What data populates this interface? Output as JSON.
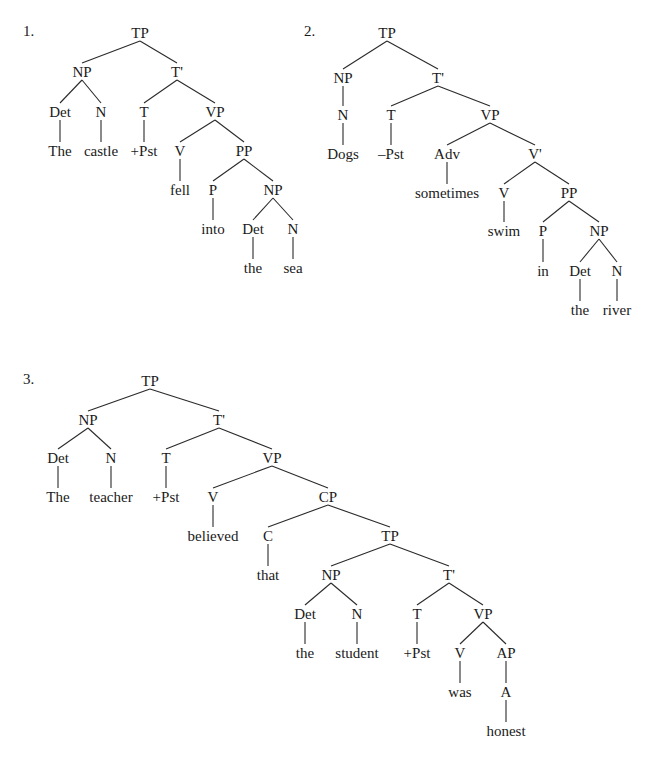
{
  "trees": [
    {
      "number": "1.",
      "number_pos": [
        23,
        30
      ],
      "nodes": [
        {
          "id": "TP",
          "label": "TP",
          "x": 140,
          "y": 33
        },
        {
          "id": "NP",
          "label": "NP",
          "x": 82,
          "y": 72,
          "parent": "TP"
        },
        {
          "id": "Tb",
          "label": "T'",
          "x": 177,
          "y": 72,
          "parent": "TP"
        },
        {
          "id": "Det",
          "label": "Det",
          "x": 60,
          "y": 112,
          "parent": "NP"
        },
        {
          "id": "N",
          "label": "N",
          "x": 101,
          "y": 112,
          "parent": "NP"
        },
        {
          "id": "T",
          "label": "T",
          "x": 144,
          "y": 112,
          "parent": "Tb"
        },
        {
          "id": "VP",
          "label": "VP",
          "x": 215,
          "y": 112,
          "parent": "Tb"
        },
        {
          "id": "w1",
          "label": "The",
          "x": 60,
          "y": 151,
          "parent": "Det",
          "straight": true
        },
        {
          "id": "w2",
          "label": "castle",
          "x": 101,
          "y": 151,
          "parent": "N",
          "straight": true
        },
        {
          "id": "w3",
          "label": "+Pst",
          "x": 144,
          "y": 151,
          "parent": "T",
          "straight": true
        },
        {
          "id": "V",
          "label": "V",
          "x": 180,
          "y": 151,
          "parent": "VP"
        },
        {
          "id": "PP",
          "label": "PP",
          "x": 244,
          "y": 151,
          "parent": "VP"
        },
        {
          "id": "w4",
          "label": "fell",
          "x": 180,
          "y": 190,
          "parent": "V",
          "straight": true
        },
        {
          "id": "P",
          "label": "P",
          "x": 213,
          "y": 190,
          "parent": "PP"
        },
        {
          "id": "NP2",
          "label": "NP",
          "x": 273,
          "y": 190,
          "parent": "PP"
        },
        {
          "id": "w5",
          "label": "into",
          "x": 213,
          "y": 229,
          "parent": "P",
          "straight": true
        },
        {
          "id": "Det2",
          "label": "Det",
          "x": 253,
          "y": 229,
          "parent": "NP2"
        },
        {
          "id": "N2",
          "label": "N",
          "x": 293,
          "y": 229,
          "parent": "NP2"
        },
        {
          "id": "w6",
          "label": "the",
          "x": 253,
          "y": 268,
          "parent": "Det2",
          "straight": true
        },
        {
          "id": "w7",
          "label": "sea",
          "x": 293,
          "y": 268,
          "parent": "N2",
          "straight": true
        }
      ]
    },
    {
      "number": "2.",
      "number_pos": [
        304,
        30
      ],
      "nodes": [
        {
          "id": "TP",
          "label": "TP",
          "x": 387,
          "y": 33
        },
        {
          "id": "NP",
          "label": "NP",
          "x": 343,
          "y": 78,
          "parent": "TP"
        },
        {
          "id": "Tb",
          "label": "T'",
          "x": 438,
          "y": 78,
          "parent": "TP"
        },
        {
          "id": "N",
          "label": "N",
          "x": 343,
          "y": 115,
          "parent": "NP",
          "straight": true
        },
        {
          "id": "T",
          "label": "T",
          "x": 391,
          "y": 115,
          "parent": "Tb"
        },
        {
          "id": "VP",
          "label": "VP",
          "x": 490,
          "y": 115,
          "parent": "Tb"
        },
        {
          "id": "w1",
          "label": "Dogs",
          "x": 343,
          "y": 154,
          "parent": "N",
          "straight": true
        },
        {
          "id": "w2",
          "label": "–Pst",
          "x": 391,
          "y": 154,
          "parent": "T",
          "straight": true
        },
        {
          "id": "Adv",
          "label": "Adv",
          "x": 447,
          "y": 154,
          "parent": "VP"
        },
        {
          "id": "Vb",
          "label": "V'",
          "x": 535,
          "y": 154,
          "parent": "VP"
        },
        {
          "id": "w3",
          "label": "sometimes",
          "x": 447,
          "y": 193,
          "parent": "Adv",
          "straight": true
        },
        {
          "id": "V",
          "label": "V",
          "x": 504,
          "y": 193,
          "parent": "Vb"
        },
        {
          "id": "PP",
          "label": "PP",
          "x": 569,
          "y": 193,
          "parent": "Vb"
        },
        {
          "id": "w4",
          "label": "swim",
          "x": 504,
          "y": 231,
          "parent": "V",
          "straight": true
        },
        {
          "id": "P",
          "label": "P",
          "x": 543,
          "y": 231,
          "parent": "PP"
        },
        {
          "id": "NP2",
          "label": "NP",
          "x": 599,
          "y": 231,
          "parent": "PP"
        },
        {
          "id": "w5",
          "label": "in",
          "x": 543,
          "y": 271,
          "parent": "P",
          "straight": true
        },
        {
          "id": "Det2",
          "label": "Det",
          "x": 580,
          "y": 271,
          "parent": "NP2"
        },
        {
          "id": "N2",
          "label": "N",
          "x": 617,
          "y": 271,
          "parent": "NP2"
        },
        {
          "id": "w6",
          "label": "the",
          "x": 580,
          "y": 310,
          "parent": "Det2",
          "straight": true
        },
        {
          "id": "w7",
          "label": "river",
          "x": 617,
          "y": 310,
          "parent": "N2",
          "straight": true
        }
      ]
    },
    {
      "number": "3.",
      "number_pos": [
        23,
        378
      ],
      "nodes": [
        {
          "id": "TP",
          "label": "TP",
          "x": 150,
          "y": 381
        },
        {
          "id": "NP",
          "label": "NP",
          "x": 88,
          "y": 420,
          "parent": "TP"
        },
        {
          "id": "Tb",
          "label": "T'",
          "x": 219,
          "y": 420,
          "parent": "TP"
        },
        {
          "id": "Det",
          "label": "Det",
          "x": 58,
          "y": 458,
          "parent": "NP"
        },
        {
          "id": "N",
          "label": "N",
          "x": 111,
          "y": 458,
          "parent": "NP"
        },
        {
          "id": "T",
          "label": "T",
          "x": 166,
          "y": 458,
          "parent": "Tb"
        },
        {
          "id": "VP",
          "label": "VP",
          "x": 272,
          "y": 458,
          "parent": "Tb"
        },
        {
          "id": "w1",
          "label": "The",
          "x": 58,
          "y": 497,
          "parent": "Det",
          "straight": true
        },
        {
          "id": "w2",
          "label": "teacher",
          "x": 111,
          "y": 497,
          "parent": "N",
          "straight": true
        },
        {
          "id": "w3",
          "label": "+Pst",
          "x": 166,
          "y": 497,
          "parent": "T",
          "straight": true
        },
        {
          "id": "V",
          "label": "V",
          "x": 213,
          "y": 497,
          "parent": "VP"
        },
        {
          "id": "CP",
          "label": "CP",
          "x": 328,
          "y": 497,
          "parent": "VP"
        },
        {
          "id": "w4",
          "label": "believed",
          "x": 213,
          "y": 536,
          "parent": "V",
          "straight": true
        },
        {
          "id": "C",
          "label": "C",
          "x": 268,
          "y": 536,
          "parent": "CP"
        },
        {
          "id": "TP2",
          "label": "TP",
          "x": 390,
          "y": 536,
          "parent": "CP"
        },
        {
          "id": "w5",
          "label": "that",
          "x": 268,
          "y": 575,
          "parent": "C",
          "straight": true
        },
        {
          "id": "NP2",
          "label": "NP",
          "x": 331,
          "y": 575,
          "parent": "TP2"
        },
        {
          "id": "Tb2",
          "label": "T'",
          "x": 449,
          "y": 575,
          "parent": "TP2"
        },
        {
          "id": "Det2",
          "label": "Det",
          "x": 305,
          "y": 614,
          "parent": "NP2"
        },
        {
          "id": "N2",
          "label": "N",
          "x": 357,
          "y": 614,
          "parent": "NP2"
        },
        {
          "id": "T2",
          "label": "T",
          "x": 417,
          "y": 614,
          "parent": "Tb2"
        },
        {
          "id": "VP2",
          "label": "VP",
          "x": 483,
          "y": 614,
          "parent": "Tb2"
        },
        {
          "id": "w6",
          "label": "the",
          "x": 305,
          "y": 653,
          "parent": "Det2",
          "straight": true
        },
        {
          "id": "w7",
          "label": "student",
          "x": 357,
          "y": 653,
          "parent": "N2",
          "straight": true
        },
        {
          "id": "w8",
          "label": "+Pst",
          "x": 417,
          "y": 653,
          "parent": "T2",
          "straight": true
        },
        {
          "id": "V2",
          "label": "V",
          "x": 460,
          "y": 653,
          "parent": "VP2"
        },
        {
          "id": "AP",
          "label": "AP",
          "x": 506,
          "y": 653,
          "parent": "VP2"
        },
        {
          "id": "w9",
          "label": "was",
          "x": 460,
          "y": 692,
          "parent": "V2",
          "straight": true
        },
        {
          "id": "A",
          "label": "A",
          "x": 506,
          "y": 692,
          "parent": "AP",
          "straight": true
        },
        {
          "id": "w10",
          "label": "honest",
          "x": 506,
          "y": 731,
          "parent": "A",
          "straight": true
        }
      ]
    }
  ]
}
